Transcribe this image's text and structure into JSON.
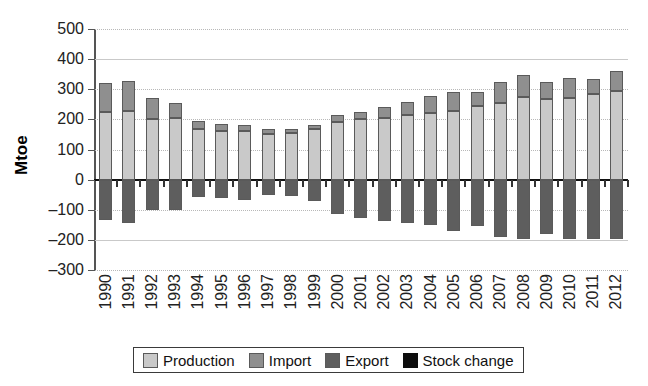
{
  "chart_data": {
    "type": "bar",
    "title": "",
    "subtitle": "",
    "xlabel": "",
    "ylabel": "Mtoe",
    "ylim": [
      -300,
      500
    ],
    "ytick_step": 100,
    "grid": true,
    "stacked": true,
    "legend_position": "bottom",
    "yticks": [
      "500",
      "400",
      "300",
      "200",
      "100",
      "0",
      "–100",
      "–200",
      "–300"
    ],
    "ytick_values": [
      500,
      400,
      300,
      200,
      100,
      0,
      -100,
      -200,
      -300
    ],
    "categories": [
      "1990",
      "1991",
      "1992",
      "1993",
      "1994",
      "1995",
      "1996",
      "1997",
      "1998",
      "1999",
      "2000",
      "2001",
      "2002",
      "2003",
      "2004",
      "2005",
      "2006",
      "2007",
      "2008",
      "2009",
      "2010",
      "2011",
      "2012"
    ],
    "series": [
      {
        "name": "Production",
        "color": "#c9c9c9",
        "values": [
          225,
          227,
          202,
          205,
          168,
          163,
          163,
          152,
          155,
          168,
          192,
          200,
          205,
          215,
          222,
          228,
          243,
          255,
          275,
          268,
          272,
          285,
          293
        ]
      },
      {
        "name": "Import",
        "color": "#8f8f8f",
        "values": [
          95,
          100,
          70,
          48,
          28,
          20,
          17,
          15,
          13,
          13,
          22,
          25,
          35,
          42,
          55,
          62,
          48,
          68,
          73,
          55,
          65,
          48,
          68
        ]
      },
      {
        "name": "Export",
        "color": "#5e5e5e",
        "values": [
          -135,
          -145,
          -100,
          -100,
          -57,
          -60,
          -68,
          -52,
          -55,
          -70,
          -115,
          -128,
          -138,
          -145,
          -150,
          -170,
          -155,
          -190,
          -198,
          -182,
          -196,
          -196,
          -198
        ]
      },
      {
        "name": "Stock change",
        "color": "#0d0d0d",
        "values": [
          -6,
          -5,
          -4,
          -4,
          -3,
          -3,
          -3,
          -3,
          -3,
          -3,
          -4,
          -4,
          -4,
          -4,
          -4,
          -5,
          -4,
          -5,
          -5,
          -4,
          -5,
          -5,
          -5
        ]
      }
    ],
    "totals_positive": [
      320,
      327,
      272,
      253,
      196,
      183,
      180,
      167,
      168,
      181,
      214,
      225,
      240,
      257,
      277,
      290,
      291,
      323,
      348,
      323,
      337,
      333,
      361
    ]
  },
  "legend": {
    "items": [
      {
        "label": "Production",
        "swatch": "production"
      },
      {
        "label": "Import",
        "swatch": "import"
      },
      {
        "label": "Export",
        "swatch": "export"
      },
      {
        "label": "Stock change",
        "swatch": "stock"
      }
    ]
  }
}
